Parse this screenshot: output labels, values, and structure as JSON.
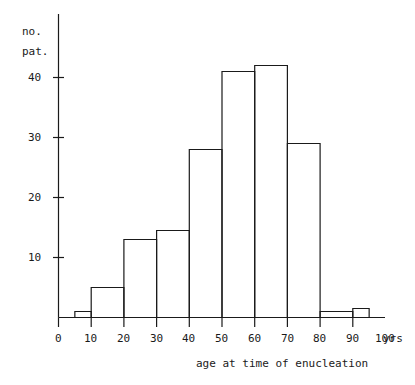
{
  "chart_data": {
    "type": "bar",
    "title": "",
    "subtitle": "",
    "xlabel": "age at time of enucleation",
    "xunit": "yrs",
    "ylabel_lines": [
      "no.",
      "pat."
    ],
    "ylabel": "no. pat.",
    "xlim": [
      0,
      100
    ],
    "ylim": [
      0,
      45
    ],
    "grid": false,
    "legend": null,
    "x_ticks": [
      "0",
      "10",
      "20",
      "30",
      "40",
      "50",
      "60",
      "70",
      "80",
      "90",
      "100"
    ],
    "x_tick_values": [
      0,
      10,
      20,
      30,
      40,
      50,
      60,
      70,
      80,
      90,
      100
    ],
    "y_ticks": [
      "10",
      "20",
      "30",
      "40"
    ],
    "y_tick_values": [
      10,
      20,
      30,
      40
    ],
    "bin_edges": [
      5,
      10,
      20,
      30,
      40,
      50,
      60,
      70,
      80,
      90,
      95
    ],
    "categories": [
      "5-10",
      "10-20",
      "20-30",
      "30-40",
      "40-50",
      "50-60",
      "60-70",
      "70-80",
      "80-90",
      "90-95"
    ],
    "values": [
      1,
      5,
      13,
      14.5,
      28,
      41,
      42,
      29,
      1,
      1.5
    ],
    "bar_fill": "#ffffff",
    "bar_stroke": "#1a1a1a",
    "axis_color": "#1a1a1a"
  }
}
